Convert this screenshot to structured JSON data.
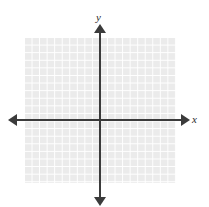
{
  "figure": {
    "title": "",
    "background_color": "#ffffff"
  },
  "axes": {
    "x_label": "x",
    "y_label": "y",
    "axis_color": "#3b3b3b",
    "x_arrow_left": "arrow-left",
    "x_arrow_right": "arrow-right",
    "y_arrow_up": "arrow-up",
    "y_arrow_down": "arrow-down"
  },
  "grid": {
    "cell_color": "#ebebeb",
    "line_color": "#ffffff",
    "columns": 20,
    "rows": 19,
    "cell_size_px": 7.5
  },
  "chart_data": {
    "type": "scatter",
    "title": "",
    "subtitle": "",
    "xlabel": "x",
    "ylabel": "y",
    "series": [
      {
        "name": "",
        "x": [],
        "y": []
      }
    ],
    "x": [],
    "categories": [],
    "values": [],
    "xlim": [
      -10,
      10
    ],
    "ylim": [
      -9,
      10
    ],
    "xticks": [],
    "yticks": [],
    "xticklabels": [],
    "yticklabels": [],
    "grid": true,
    "legend": null,
    "annotations": []
  }
}
